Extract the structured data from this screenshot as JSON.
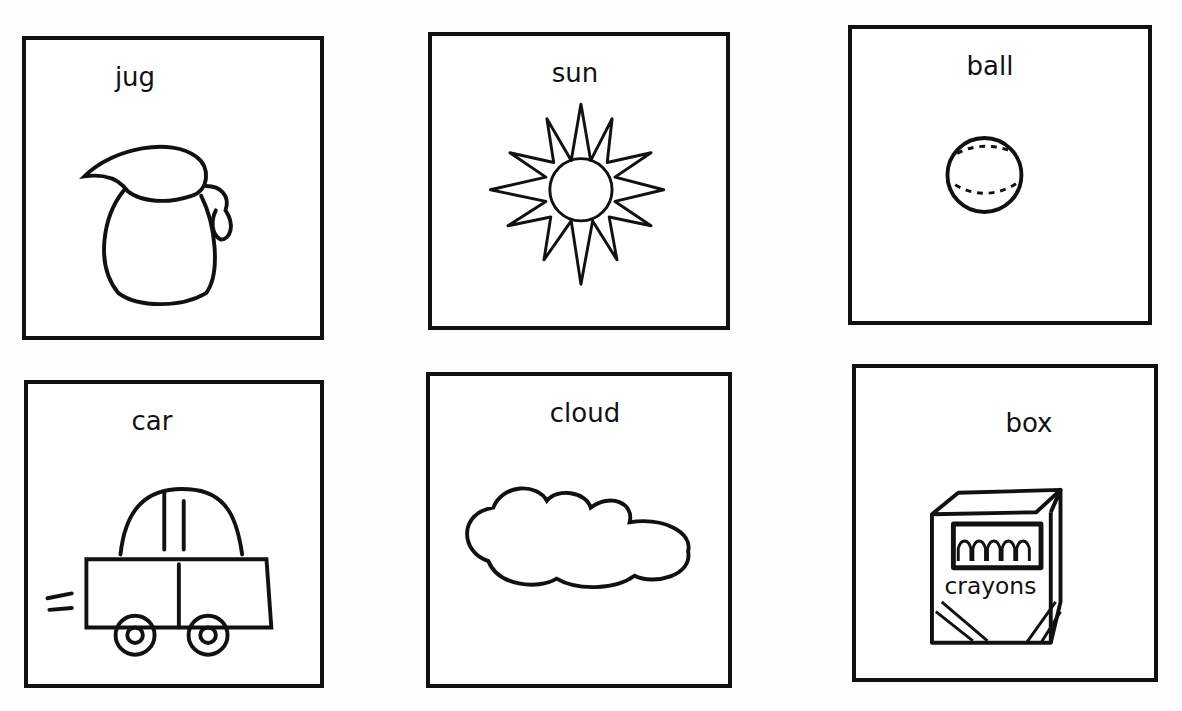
{
  "cards": [
    {
      "label": "jug",
      "icon": "jug-icon"
    },
    {
      "label": "sun",
      "icon": "sun-icon"
    },
    {
      "label": "ball",
      "icon": "ball-icon"
    },
    {
      "label": "car",
      "icon": "car-icon"
    },
    {
      "label": "cloud",
      "icon": "cloud-icon"
    },
    {
      "label": "box",
      "icon": "crayon-box-icon",
      "box_text": "crayons"
    }
  ]
}
